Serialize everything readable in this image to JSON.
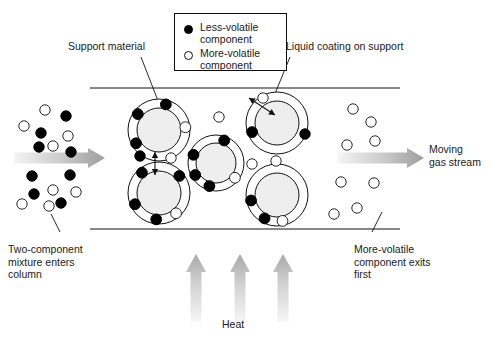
{
  "figure": {
    "type": "diagram",
    "background": "#ffffff"
  },
  "legend": {
    "items": [
      {
        "marker": "filled-circle",
        "label": "Less-volatile\ncomponent",
        "color": "#000000"
      },
      {
        "marker": "open-circle",
        "label": "More-volatile\ncomponent",
        "color": "#ffffff"
      }
    ]
  },
  "labels": {
    "support_material": "Support material",
    "liquid_coating": "Liquid coating on support",
    "moving_gas_stream": "Moving\ngas stream",
    "inlet": "Two-component\nmixture enters\ncolumn",
    "outlet": "More-volatile\ncomponent exits\nfirst",
    "heat": "Heat"
  },
  "colors": {
    "ink": "#1a1a1a",
    "line": "#111111",
    "filled_particle": "#000000",
    "open_particle": "#ffffff",
    "support_fill": "#eeeeee",
    "arrow_light": "#f2f2f2",
    "arrow_dark": "#9a9a9a"
  },
  "chart_data": {
    "type": "diagram",
    "column": {
      "x0": 90,
      "x1": 400,
      "y_top": 88,
      "y_bottom": 229
    },
    "support_particles": [
      {
        "cx": 159,
        "cy": 130,
        "r_inner": 22,
        "r_outer": 31,
        "beads": [
          {
            "t": "filled",
            "a": -75
          },
          {
            "t": "filled",
            "a": -143
          },
          {
            "t": "filled",
            "a": 150
          },
          {
            "t": "open",
            "a": -6
          }
        ]
      },
      {
        "cx": 159,
        "cy": 193,
        "r_inner": 22,
        "r_outer": 31,
        "beads": [
          {
            "t": "filled",
            "a": -130
          },
          {
            "t": "filled",
            "a": -40
          },
          {
            "t": "filled",
            "a": 155
          },
          {
            "t": "filled",
            "a": 96
          },
          {
            "t": "open",
            "a": 50
          }
        ]
      },
      {
        "cx": 216,
        "cy": 163,
        "r_inner": 20,
        "r_outer": 28,
        "beads": [
          {
            "t": "filled",
            "a": -70
          },
          {
            "t": "filled",
            "a": -160
          },
          {
            "t": "filled",
            "a": 150
          },
          {
            "t": "filled",
            "a": 106
          },
          {
            "t": "open",
            "a": 38
          }
        ]
      },
      {
        "cx": 277,
        "cy": 123,
        "r_inner": 22,
        "r_outer": 31,
        "beads": [
          {
            "t": "filled",
            "a": 160
          }
        ]
      },
      {
        "cx": 277,
        "cy": 195,
        "r_inner": 22,
        "r_outer": 31,
        "beads": [
          {
            "t": "filled",
            "a": 168
          },
          {
            "t": "filled",
            "a": 118
          },
          {
            "t": "open",
            "a": 78
          }
        ]
      }
    ],
    "free_beads_in_column": [
      {
        "t": "filled",
        "cx": 140,
        "cy": 156
      },
      {
        "t": "open",
        "cx": 171,
        "cy": 158
      },
      {
        "t": "open",
        "cx": 219,
        "cy": 117
      },
      {
        "t": "open",
        "cx": 252,
        "cy": 164
      },
      {
        "t": "open",
        "cx": 276,
        "cy": 161
      },
      {
        "t": "filled",
        "cx": 305,
        "cy": 134
      },
      {
        "t": "open",
        "cx": 263,
        "cy": 98
      }
    ],
    "inlet_beads": [
      {
        "t": "open",
        "cx": 45,
        "cy": 110
      },
      {
        "t": "filled",
        "cx": 66,
        "cy": 116
      },
      {
        "t": "open",
        "cx": 24,
        "cy": 126
      },
      {
        "t": "filled",
        "cx": 41,
        "cy": 133
      },
      {
        "t": "open",
        "cx": 53,
        "cy": 146
      },
      {
        "t": "open",
        "cx": 68,
        "cy": 136
      },
      {
        "t": "filled",
        "cx": 39,
        "cy": 147
      },
      {
        "t": "filled",
        "cx": 71,
        "cy": 152
      },
      {
        "t": "filled",
        "cx": 32,
        "cy": 176
      },
      {
        "t": "filled",
        "cx": 70,
        "cy": 175
      },
      {
        "t": "open",
        "cx": 53,
        "cy": 190
      },
      {
        "t": "filled",
        "cx": 34,
        "cy": 194
      },
      {
        "t": "open",
        "cx": 76,
        "cy": 192
      },
      {
        "t": "open",
        "cx": 22,
        "cy": 204
      },
      {
        "t": "open",
        "cx": 49,
        "cy": 206
      },
      {
        "t": "filled",
        "cx": 61,
        "cy": 203
      }
    ],
    "outlet_beads": [
      {
        "t": "open",
        "cx": 353,
        "cy": 109
      },
      {
        "t": "open",
        "cx": 371,
        "cy": 122
      },
      {
        "t": "open",
        "cx": 347,
        "cy": 145
      },
      {
        "t": "open",
        "cx": 375,
        "cy": 141
      },
      {
        "t": "open",
        "cx": 341,
        "cy": 182
      },
      {
        "t": "open",
        "cx": 374,
        "cy": 183
      },
      {
        "t": "open",
        "cx": 357,
        "cy": 208
      },
      {
        "t": "open",
        "cx": 334,
        "cy": 214
      }
    ],
    "flow_arrows": [
      {
        "name": "inlet-flow",
        "x0": 14,
        "y0": 158,
        "x1": 105,
        "y1": 158,
        "dir": "right"
      },
      {
        "name": "outlet-flow",
        "x0": 338,
        "y0": 158,
        "x1": 424,
        "y1": 158,
        "dir": "right"
      }
    ],
    "heat_arrows": [
      {
        "x": 196,
        "y_base": 322,
        "y_tip": 254
      },
      {
        "x": 240,
        "y_base": 322,
        "y_tip": 254
      },
      {
        "x": 283,
        "y_base": 322,
        "y_tip": 254
      }
    ],
    "exchange_arrows": [
      {
        "name": "vertical-equilibrium",
        "x0": 155,
        "y0": 175,
        "x1": 155,
        "y1": 152
      },
      {
        "name": "diagonal-equilibrium",
        "x0": 275,
        "y0": 115,
        "x1": 249,
        "y1": 98
      }
    ],
    "leader_lines": [
      {
        "name": "support-material-leader",
        "x0": 141,
        "y0": 57,
        "x1": 160,
        "y1": 106
      },
      {
        "name": "liquid-coating-leader",
        "x0": 290,
        "y0": 57,
        "x1": 272,
        "y1": 101
      },
      {
        "name": "inlet-leader",
        "x0": 60,
        "y0": 232,
        "x1": 51,
        "y1": 214
      },
      {
        "name": "outlet-leader",
        "x0": 372,
        "y0": 232,
        "x1": 382,
        "y1": 212
      }
    ]
  }
}
